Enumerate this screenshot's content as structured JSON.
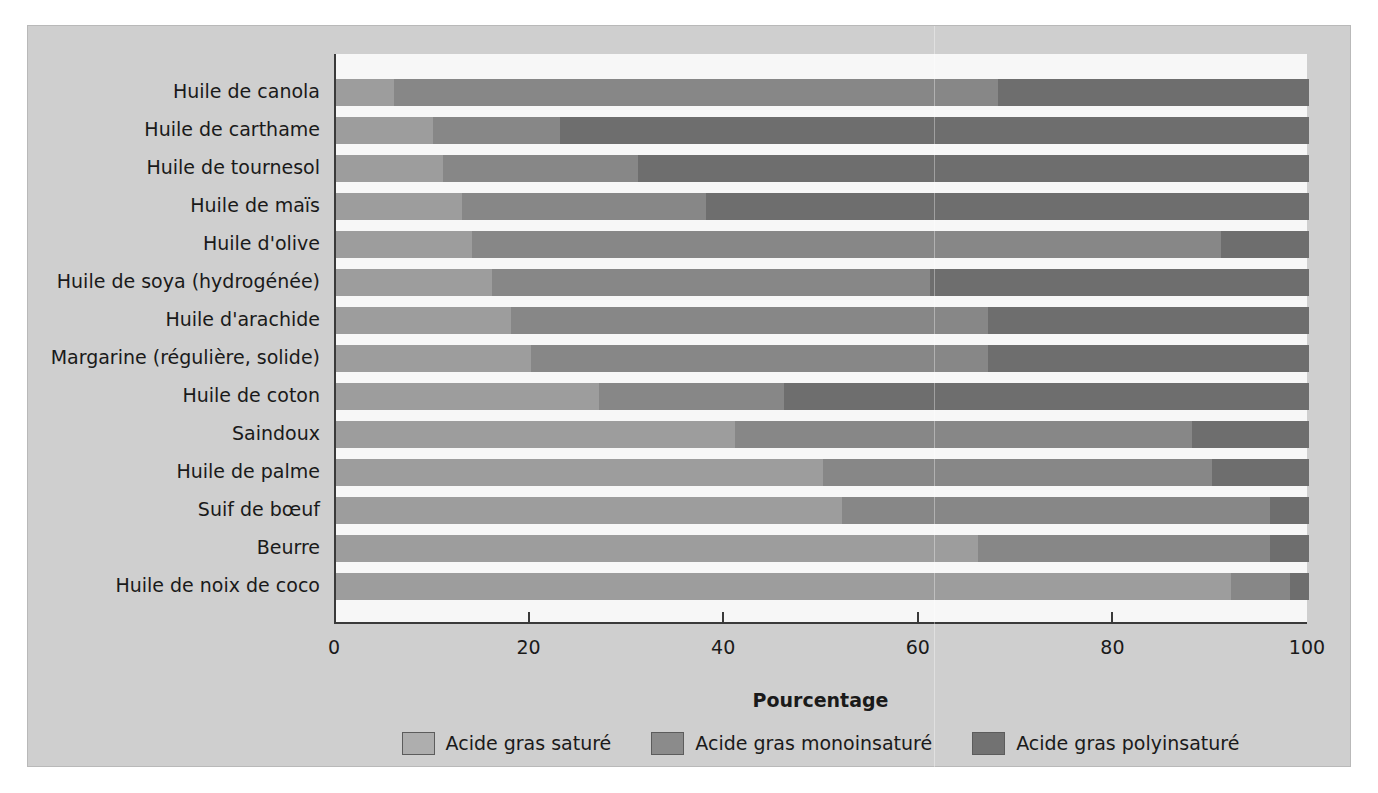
{
  "chart_data": {
    "type": "bar",
    "orientation": "horizontal",
    "stacked": true,
    "title": "",
    "xlabel": "Pourcentage",
    "ylabel": "",
    "xlim": [
      0,
      100
    ],
    "xticks": [
      "0",
      "20",
      "40",
      "60",
      "80",
      "100"
    ],
    "grid": false,
    "legend_position": "bottom",
    "categories": [
      "Huile de canola",
      "Huile de carthame",
      "Huile de tournesol",
      "Huile de maïs",
      "Huile d'olive",
      "Huile de soya (hydrogénée)",
      "Huile d'arachide",
      "Margarine (régulière, solide)",
      "Huile de coton",
      "Saindoux",
      "Huile de palme",
      "Suif de bœuf",
      "Beurre",
      "Huile de noix de coco"
    ],
    "series": [
      {
        "name": "Acide gras saturé",
        "color": "#9d9d9d",
        "values": [
          6,
          10,
          11,
          13,
          14,
          16,
          18,
          20,
          27,
          41,
          50,
          52,
          66,
          92
        ]
      },
      {
        "name": "Acide gras monoinsaturé",
        "color": "#878787",
        "values": [
          62,
          13,
          20,
          25,
          77,
          45,
          49,
          47,
          19,
          47,
          40,
          44,
          30,
          6
        ]
      },
      {
        "name": "Acide gras polyinsaturé",
        "color": "#6e6e6e",
        "values": [
          32,
          77,
          69,
          62,
          9,
          39,
          33,
          33,
          54,
          12,
          10,
          4,
          4,
          2
        ]
      }
    ],
    "stack_boundaries": [
      {
        "category": "Huile de canola",
        "sat_end": 6,
        "mono_end": 68
      },
      {
        "category": "Huile de carthame",
        "sat_end": 10,
        "mono_end": 23
      },
      {
        "category": "Huile de tournesol",
        "sat_end": 11,
        "mono_end": 31
      },
      {
        "category": "Huile de maïs",
        "sat_end": 13,
        "mono_end": 38
      },
      {
        "category": "Huile d'olive",
        "sat_end": 14,
        "mono_end": 91
      },
      {
        "category": "Huile de soya (hydrogénée)",
        "sat_end": 16,
        "mono_end": 61
      },
      {
        "category": "Huile d'arachide",
        "sat_end": 18,
        "mono_end": 67
      },
      {
        "category": "Margarine (régulière, solide)",
        "sat_end": 20,
        "mono_end": 67
      },
      {
        "category": "Huile de coton",
        "sat_end": 27,
        "mono_end": 46
      },
      {
        "category": "Saindoux",
        "sat_end": 41,
        "mono_end": 88
      },
      {
        "category": "Huile de palme",
        "sat_end": 50,
        "mono_end": 90
      },
      {
        "category": "Suif de bœuf",
        "sat_end": 52,
        "mono_end": 96
      },
      {
        "category": "Beurre",
        "sat_end": 66,
        "mono_end": 96
      },
      {
        "category": "Huile de noix de coco",
        "sat_end": 92,
        "mono_end": 98
      }
    ]
  },
  "axis": {
    "x_title": "Pourcentage",
    "ticks": [
      "0",
      "20",
      "40",
      "60",
      "80",
      "100"
    ],
    "tick_values": [
      0,
      20,
      40,
      60,
      80,
      100
    ]
  },
  "legend": {
    "items": [
      {
        "label": "Acide gras saturé",
        "swatch": "sat"
      },
      {
        "label": "Acide gras monoinsaturé",
        "swatch": "mono"
      },
      {
        "label": "Acide gras polyinsaturé",
        "swatch": "poly"
      }
    ]
  },
  "colors": {
    "saturated": "#9d9d9d",
    "monounsaturated": "#878787",
    "polyunsaturated": "#6e6e6e",
    "figure_background": "#cfcfcf",
    "plot_background": "#f7f7f7",
    "axis": "#3a3a3a"
  }
}
